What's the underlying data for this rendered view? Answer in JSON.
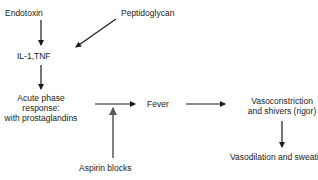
{
  "diagram": {
    "nodes": {
      "endotoxin": "Endotoxin",
      "peptidoglycan": "Peptidoglycan",
      "il1_tnf": "IL-1,TNF",
      "acute_phase_1": "Acute phase",
      "acute_phase_2": "response:",
      "acute_phase_3": "with prostaglandins",
      "fever": "Fever",
      "vasoconstriction_1": "Vasoconstriction",
      "vasoconstriction_2": "and shivers (rigor)",
      "vasodilation": "Vasodilation and sweating",
      "aspirin": "Aspirin blocks"
    },
    "edges": [
      {
        "from": "Endotoxin",
        "to": "IL-1,TNF"
      },
      {
        "from": "Peptidoglycan",
        "to": "IL-1,TNF"
      },
      {
        "from": "IL-1,TNF",
        "to": "Acute phase response: with prostaglandins"
      },
      {
        "from": "Acute phase response: with prostaglandins",
        "to": "Fever"
      },
      {
        "from": "Aspirin blocks",
        "to": "Acute phase response -> Fever",
        "style": "inhibit"
      },
      {
        "from": "Fever",
        "to": "Vasoconstriction and shivers (rigor)"
      },
      {
        "from": "Vasoconstriction and shivers (rigor)",
        "to": "Vasodilation and sweating"
      }
    ],
    "colors": {
      "arrow": "#1a1a1a",
      "inhibit_arrow": "#555555",
      "text": "#1a1a1a",
      "background": "#ffffff"
    }
  }
}
